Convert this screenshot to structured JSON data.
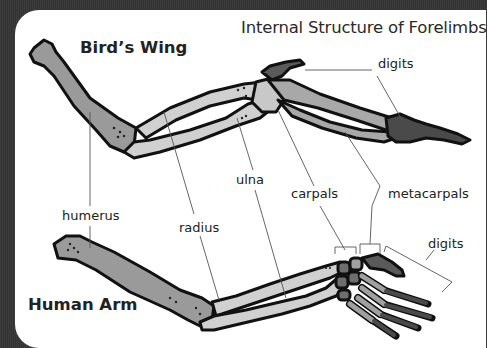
{
  "title": "Internal Structure of Forelimbs",
  "diagrams": {
    "bird": {
      "heading": "Bird’s Wing"
    },
    "human": {
      "heading": "Human Arm"
    }
  },
  "labels": {
    "digits_top": "digits",
    "humerus": "humerus",
    "radius": "radius",
    "ulna": "ulna",
    "carpals": "carpals",
    "metacarpals": "metacarpals",
    "digits_bottom": "digits"
  },
  "colors": {
    "background": "#3a3a3a",
    "panel": "#ffffff",
    "humerus_fill": "#9a9a9a",
    "radius_ulna_fill": "#d0d0d0",
    "carpal_fill": "#6e6e6e",
    "metacarpal_fill": "#a0a0a0",
    "digit_fill": "#4a4a4a",
    "outline": "#111111",
    "leader_line": "#555555"
  }
}
